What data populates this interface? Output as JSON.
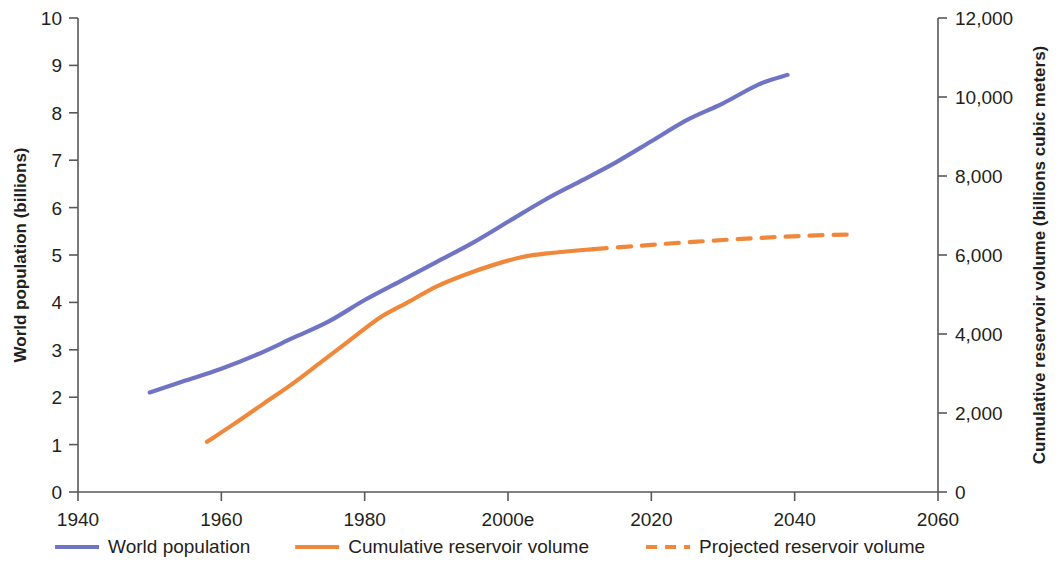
{
  "chart_data": {
    "type": "line",
    "title": "",
    "subtitle": "",
    "xlabel": "",
    "ylabel": "World population (billions)",
    "y2label": "Cumulative reservoir volume (billions cubic meters)",
    "xlim": [
      1940,
      2060
    ],
    "ylim": [
      0,
      10
    ],
    "y2lim": [
      0,
      12000
    ],
    "grid": false,
    "legend_position": "bottom",
    "xticks": [
      1940,
      1960,
      1980,
      "2000e",
      2020,
      2040,
      2060
    ],
    "xtick_values": [
      1940,
      1960,
      1980,
      2000,
      2020,
      2040,
      2060
    ],
    "yticks": [
      0,
      1,
      2,
      3,
      4,
      5,
      6,
      7,
      8,
      9,
      10
    ],
    "y2ticks": [
      0,
      2000,
      4000,
      6000,
      8000,
      10000,
      12000
    ],
    "y2tick_labels": [
      "0",
      "2,000",
      "4,000",
      "6,000",
      "8,000",
      "10,000",
      "12,000"
    ],
    "series": [
      {
        "name": "World population",
        "axis": "left",
        "style": "solid",
        "color": "#6f74c4",
        "x": [
          1950,
          1955,
          1960,
          1965,
          1970,
          1975,
          1980,
          1985,
          1990,
          1995,
          2000,
          2005,
          2010,
          2015,
          2020,
          2025,
          2030,
          2035,
          2039
        ],
        "values": [
          2.1,
          2.35,
          2.6,
          2.9,
          3.25,
          3.6,
          4.05,
          4.45,
          4.85,
          5.25,
          5.7,
          6.15,
          6.55,
          6.95,
          7.4,
          7.85,
          8.2,
          8.6,
          8.8
        ]
      },
      {
        "name": "Cumulative reservoir volume",
        "axis": "right",
        "style": "solid",
        "color": "#f0883c",
        "x": [
          1958,
          1962,
          1966,
          1970,
          1974,
          1978,
          1982,
          1986,
          1990,
          1994,
          1998,
          2002,
          2006,
          2012
        ],
        "values": [
          1270,
          1750,
          2250,
          2750,
          3300,
          3850,
          4400,
          4800,
          5200,
          5500,
          5750,
          5950,
          6050,
          6150
        ]
      },
      {
        "name": "Projected reservoir volume",
        "axis": "right",
        "style": "dashed",
        "color": "#f0883c",
        "x": [
          2012,
          2018,
          2024,
          2030,
          2036,
          2042,
          2048
        ],
        "values": [
          6150,
          6230,
          6310,
          6380,
          6440,
          6490,
          6520
        ]
      }
    ],
    "legend": [
      {
        "label": "World population",
        "color": "#6f74c4",
        "style": "solid"
      },
      {
        "label": "Cumulative reservoir volume",
        "color": "#f0883c",
        "style": "solid"
      },
      {
        "label": "Projected reservoir volume",
        "color": "#f0883c",
        "style": "dashed"
      }
    ]
  }
}
